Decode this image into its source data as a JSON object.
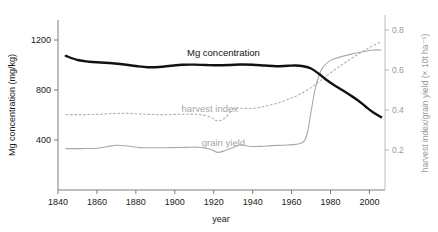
{
  "chart_data": {
    "type": "line",
    "title": "",
    "xlabel": "year",
    "ylabel": "Mg concentration (mg/kg)",
    "ylabel_right": "harvest index/grain yield (× 10t ha⁻¹)",
    "xlim": [
      1840,
      2008
    ],
    "ylim": [
      0,
      1400
    ],
    "ylim_right": [
      0.0,
      0.875
    ],
    "grid": false,
    "legend": "inline-annotations",
    "xticks": [
      1840,
      1860,
      1880,
      1900,
      1920,
      1940,
      1960,
      1980,
      2000
    ],
    "xtick_labels": [
      "1840",
      "1860",
      "1880",
      "1900",
      "1920",
      "1940",
      "1960",
      "1980",
      "2000"
    ],
    "yticks": [
      400,
      800,
      1200
    ],
    "ytick_labels": [
      "400",
      "800",
      "1200"
    ],
    "yticks_right": [
      0.2,
      0.4,
      0.6,
      0.8
    ],
    "ytick_labels_right": [
      "0.2",
      "0.4",
      "0.6",
      "0.8"
    ],
    "annotations": [
      {
        "text": "Mg concentration",
        "year": 1925,
        "axis": "left",
        "color": "#111111"
      },
      {
        "text": "harvest index",
        "year": 1918,
        "axis": "right",
        "color": "#a6a6a6"
      },
      {
        "text": "grain yield",
        "year": 1925,
        "axis": "right",
        "color": "#a6a6a6"
      }
    ],
    "series": [
      {
        "name": "Mg concentration",
        "axis": "left",
        "units": "mg/kg",
        "color": "#111111",
        "style": "solid-thick",
        "x": [
          1844,
          1850,
          1856,
          1862,
          1868,
          1874,
          1880,
          1886,
          1892,
          1898,
          1904,
          1910,
          1916,
          1922,
          1928,
          1934,
          1940,
          1946,
          1952,
          1958,
          1962,
          1966,
          1970,
          1974,
          1978,
          1982,
          1986,
          1990,
          1994,
          1998,
          2002,
          2006
        ],
        "values": [
          1073,
          1040,
          1026,
          1020,
          1014,
          1004,
          992,
          982,
          984,
          994,
          1002,
          1003,
          1000,
          998,
          1000,
          1004,
          1002,
          996,
          990,
          994,
          996,
          990,
          972,
          930,
          880,
          838,
          800,
          760,
          718,
          668,
          620,
          583
        ]
      },
      {
        "name": "harvest index",
        "axis": "right",
        "units": "",
        "color": "#b0b0b0",
        "style": "dashed",
        "x": [
          1844,
          1852,
          1860,
          1868,
          1876,
          1884,
          1892,
          1900,
          1906,
          1912,
          1918,
          1922,
          1926,
          1930,
          1934,
          1940,
          1946,
          1952,
          1958,
          1964,
          1970,
          1976,
          1982,
          1988,
          1994,
          2000,
          2006
        ],
        "values": [
          0.377,
          0.377,
          0.378,
          0.382,
          0.383,
          0.379,
          0.377,
          0.378,
          0.379,
          0.378,
          0.366,
          0.345,
          0.362,
          0.404,
          0.409,
          0.408,
          0.418,
          0.432,
          0.452,
          0.478,
          0.512,
          0.556,
          0.6,
          0.64,
          0.678,
          0.712,
          0.742
        ]
      },
      {
        "name": "grain yield",
        "axis": "right",
        "units": "× 10t ha⁻¹",
        "color": "#a9a9a9",
        "style": "solid-thin",
        "x": [
          1844,
          1852,
          1860,
          1866,
          1870,
          1876,
          1882,
          1890,
          1898,
          1906,
          1912,
          1918,
          1922,
          1926,
          1930,
          1934,
          1938,
          1944,
          1950,
          1956,
          1962,
          1966,
          1968,
          1970,
          1972,
          1974,
          1976,
          1980,
          1984,
          1990,
          1996,
          2002,
          2006
        ],
        "values": [
          0.207,
          0.207,
          0.209,
          0.218,
          0.224,
          0.22,
          0.212,
          0.211,
          0.212,
          0.213,
          0.214,
          0.205,
          0.188,
          0.198,
          0.213,
          0.226,
          0.219,
          0.218,
          0.222,
          0.224,
          0.228,
          0.24,
          0.28,
          0.39,
          0.5,
          0.57,
          0.612,
          0.648,
          0.662,
          0.678,
          0.69,
          0.7,
          0.7
        ]
      }
    ]
  }
}
